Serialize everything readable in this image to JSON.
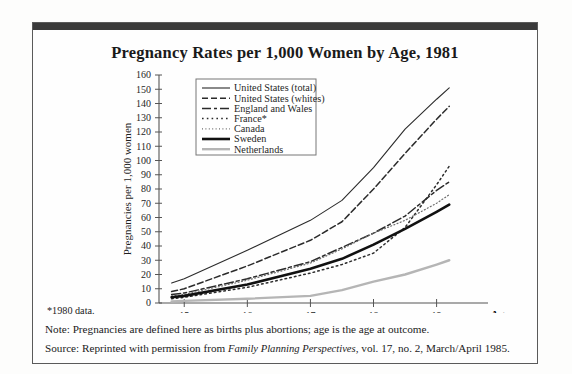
{
  "figure": {
    "title": "Pregnancy Rates per 1,000 Women by Age, 1981",
    "footnote": "*1980 data.",
    "note_line": "Note: Pregnancies are defined here as births plus abortions; age is the age at outcome.",
    "source_prefix": "Source: Reprinted with permission from ",
    "source_italic": "Family Planning Perspectives",
    "source_suffix": ", vol. 17, no. 2, March/April 1985."
  },
  "chart_data": {
    "type": "line",
    "title": "Pregnancy Rates per 1,000 Women by Age, 1981",
    "xlabel": "Age",
    "ylabel": "Pregnancies per 1,000 women",
    "x": [
      14.8,
      15,
      16,
      17,
      17.5,
      18,
      18.5,
      19,
      19.2
    ],
    "xticks": [
      15,
      16,
      17,
      18,
      19
    ],
    "xlim": [
      14.6,
      19.45
    ],
    "ylim": [
      0,
      160
    ],
    "yticks": [
      0,
      10,
      20,
      30,
      40,
      50,
      60,
      70,
      80,
      90,
      100,
      110,
      120,
      130,
      140,
      150,
      160
    ],
    "grid": false,
    "legend_position": "upper-left-inside",
    "series": [
      {
        "name": "United States (total)",
        "style": "solid-thin",
        "color": "#2b2b2b",
        "width": 1.1,
        "dash": "",
        "values": [
          14,
          17,
          37,
          58,
          72,
          95,
          122,
          143,
          151
        ]
      },
      {
        "name": "United States (whites)",
        "style": "dashed",
        "color": "#2b2b2b",
        "width": 1.5,
        "dash": "6,3",
        "values": [
          8,
          10,
          26,
          44,
          57,
          80,
          105,
          129,
          138
        ]
      },
      {
        "name": "England and Wales",
        "style": "dash-dot",
        "color": "#2b2b2b",
        "width": 1.5,
        "dash": "9,3,3,3",
        "values": [
          6,
          7,
          17,
          29,
          39,
          49,
          61,
          79,
          85
        ]
      },
      {
        "name": "France*",
        "style": "dotted-medium",
        "color": "#2b2b2b",
        "width": 1.5,
        "dash": "1.6,3.2",
        "values": [
          3,
          4,
          11,
          21,
          27,
          35,
          53,
          83,
          96
        ]
      },
      {
        "name": "Canada",
        "style": "dotted-fine",
        "color": "#6d6d6d",
        "width": 1.2,
        "dash": "1,2.4",
        "values": [
          5,
          6,
          16,
          28,
          38,
          49,
          58,
          70,
          76
        ]
      },
      {
        "name": "Sweden",
        "style": "solid-thick",
        "color": "#111111",
        "width": 2.6,
        "dash": "",
        "values": [
          4,
          5,
          13,
          24,
          31,
          41,
          52,
          64,
          69
        ]
      },
      {
        "name": "Netherlands",
        "style": "solid-gray",
        "color": "#b5b5b5",
        "width": 2.4,
        "dash": "",
        "values": [
          1,
          1.5,
          3,
          5,
          9,
          15,
          20,
          27,
          30
        ]
      }
    ]
  }
}
